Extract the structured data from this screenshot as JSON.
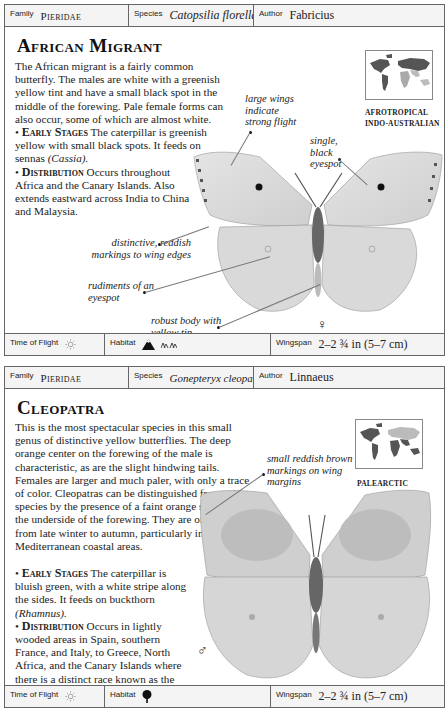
{
  "cards": [
    {
      "header": {
        "family_label": "Family",
        "family_value": "Pieridae",
        "species_label": "Species",
        "species_value": "Catopsilia florella",
        "author_label": "Author",
        "author_value": "Fabricius"
      },
      "title": "African Migrant",
      "intro": "The African migrant is a fairly common butterfly. The males are white with a greenish yellow tint and have a small black spot in the middle of the forewing. Pale female forms can also occur, some of which are almost white.",
      "early_stages_label": "Early Stages",
      "early_stages_text": "The caterpillar is greenish yellow with small black spots. It feeds on sennas",
      "early_stages_genus": "(Cassia).",
      "distribution_label": "Distribution",
      "distribution_text": "Occurs throughout Africa and the Canary Islands. Also extends eastward across India to China and Malaysia.",
      "map_regions": [
        "AFROTROPICAL",
        "INDO-AUSTRALIAN"
      ],
      "annotations": [
        "large wings indicate strong flight",
        "single, black eyespot",
        "distinctive, reddish markings to wing edges",
        "rudiments of an eyespot",
        "robust body with yellow tip"
      ],
      "sex_symbol": "♀",
      "footer": {
        "time_label": "Time of Flight",
        "time_icon": "sun-icon",
        "habitat_label": "Habitat",
        "habitat_icons": [
          "mountain-icon",
          "grassland-icon"
        ],
        "wingspan_label": "Wingspan",
        "wingspan_value": "2–2 ¾ in (5–7 cm)"
      }
    },
    {
      "header": {
        "family_label": "Family",
        "family_value": "Pieridae",
        "species_label": "Species",
        "species_value": "Gonepteryx cleopatra",
        "author_label": "Author",
        "author_value": "Linnaeus"
      },
      "title": "Cleopatra",
      "intro": "This is the most spectacular species in this small genus of distinctive yellow butterflies. The deep orange center on the forewing of the male is characteristic, as are the slight hindwing tails. Females are larger and much paler, with only a trace of color. Cleopatras can be distinguished from other species by the presence of a faint orange streak on the underside of the forewing. They are on the wing from late winter to autumn, particularly in Mediterranean coastal areas.",
      "early_stages_label": "Early Stages",
      "early_stages_text": "The caterpillar is bluish green, with a white stripe along the sides. It feeds on buckthorn",
      "early_stages_genus": "(Rhamnus).",
      "distribution_label": "Distribution",
      "distribution_text": "Occurs in lightly wooded areas in Spain, southern France, and Italy, to Greece, North Africa, and the Canary Islands where there is a distinct race known as the Canary Island brimstone.",
      "map_regions": [
        "PALEARCTIC"
      ],
      "annotations": [
        "small reddish brown markings on wing margins"
      ],
      "sex_symbol": "♂",
      "footer": {
        "time_label": "Time of Flight",
        "time_icon": "sun-icon",
        "habitat_label": "Habitat",
        "habitat_icons": [
          "tree-icon"
        ],
        "wingspan_label": "Wingspan",
        "wingspan_value": "2–2 ¾ in (5–7 cm)"
      }
    }
  ]
}
